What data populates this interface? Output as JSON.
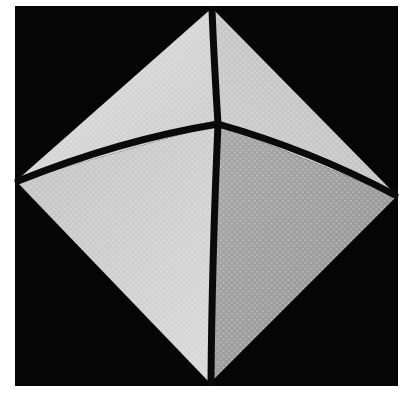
{
  "figure": {
    "background_color": "#000000",
    "frame": {
      "x": 15,
      "y": 6,
      "width": 383,
      "height": 380
    },
    "vertices": {
      "top": [
        212,
        8
      ],
      "right": [
        397,
        196
      ],
      "bottom": [
        210,
        383
      ],
      "left": [
        16,
        181
      ],
      "apex": [
        218,
        124
      ]
    },
    "faces": [
      {
        "name": "top-left",
        "color": "#d4d4d4"
      },
      {
        "name": "top-right",
        "color": "#c6c6c6"
      },
      {
        "name": "bottom-left",
        "color": "#cdcdcd"
      },
      {
        "name": "bottom-right",
        "color": "#9e9e9e"
      }
    ],
    "edge_color": "#0a0a0a",
    "edge_width": 7
  },
  "caption": {
    "text": "",
    "note": "caption cropped at bottom edge; only glyph tops visible"
  }
}
